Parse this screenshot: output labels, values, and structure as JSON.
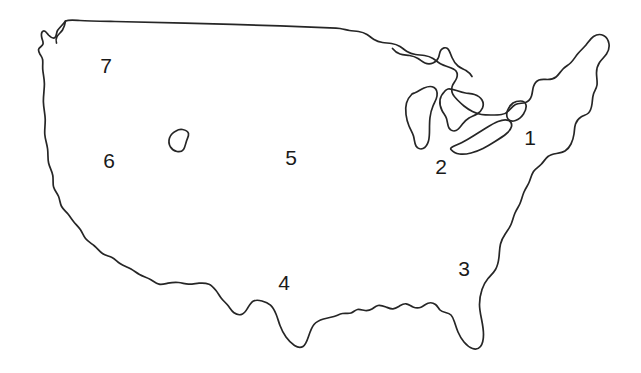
{
  "figure": {
    "type": "outline-map",
    "background_color": "#ffffff",
    "outline_color": "#262626",
    "label_color": "#1a1a1a",
    "width": 641,
    "height": 373
  },
  "labels": [
    {
      "id": "region-1",
      "text": "1",
      "x": 530,
      "y": 137
    },
    {
      "id": "region-2",
      "text": "2",
      "x": 441,
      "y": 166
    },
    {
      "id": "region-3",
      "text": "3",
      "x": 464,
      "y": 268
    },
    {
      "id": "region-4",
      "text": "4",
      "x": 284,
      "y": 282
    },
    {
      "id": "region-5",
      "text": "5",
      "x": 291,
      "y": 157
    },
    {
      "id": "region-6",
      "text": "6",
      "x": 109,
      "y": 160
    },
    {
      "id": "region-7",
      "text": "7",
      "x": 106,
      "y": 65
    }
  ],
  "features": [
    {
      "id": "national-border",
      "name": "us-outline"
    },
    {
      "id": "interior-lake",
      "name": "great-salt-lake"
    }
  ]
}
